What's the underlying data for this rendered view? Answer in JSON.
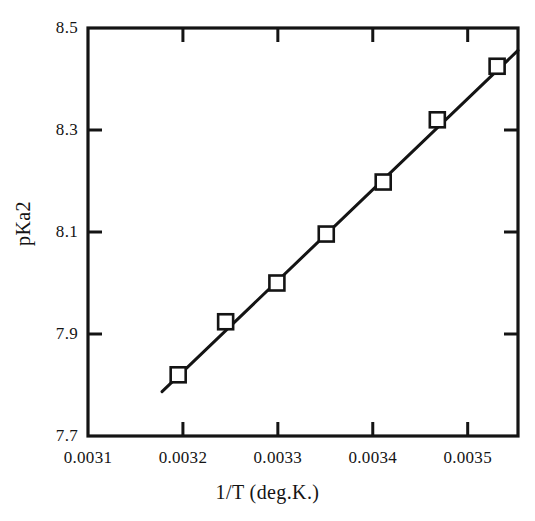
{
  "chart_data": {
    "type": "scatter",
    "title": "",
    "subtitle": "",
    "xlabel": "1/T (deg.K.)",
    "ylabel": "pKa2",
    "xlim": [
      0.0031,
      0.003553
    ],
    "ylim": [
      7.7,
      8.5
    ],
    "xticks": [
      0.0031,
      0.0032,
      0.0033,
      0.0034,
      0.0035
    ],
    "xtick_labels": [
      "0.0031",
      "0.0032",
      "0.0033",
      "0.0034",
      "0.0035"
    ],
    "yticks": [
      7.7,
      7.9,
      8.1,
      8.3,
      8.5
    ],
    "ytick_labels": [
      "7.7",
      "7.9",
      "8.1",
      "8.3",
      "8.5"
    ],
    "grid": false,
    "legend": null,
    "marker": "open-square",
    "marker_color": "#141414",
    "line_color": "#141414",
    "series": [
      {
        "name": "pKa2 vs 1/T",
        "x": [
          0.003195,
          0.003245,
          0.003299,
          0.003351,
          0.003411,
          0.003468,
          0.003531
        ],
        "y": [
          7.82,
          7.924,
          8.0,
          8.096,
          8.198,
          8.32,
          8.425
        ]
      }
    ],
    "fit_line": {
      "x": [
        0.003178,
        0.003553
      ],
      "y": [
        7.787,
        8.456
      ]
    },
    "annotations": []
  },
  "axis": {
    "frame_color": "#141414",
    "background": "#ffffff"
  }
}
